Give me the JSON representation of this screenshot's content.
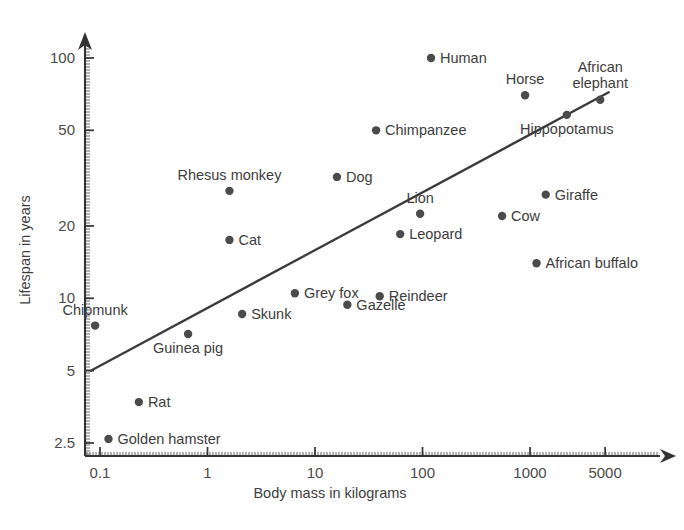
{
  "chart_data": {
    "type": "scatter",
    "title": "",
    "xlabel": "Body mass in kilograms",
    "ylabel": "Lifespan in years",
    "xscale": "log",
    "yscale": "log",
    "xlim": [
      0.07,
      9000
    ],
    "ylim": [
      2.1,
      135
    ],
    "grid": false,
    "legend": null,
    "xticks": [
      0.1,
      1,
      10,
      100,
      1000,
      5000
    ],
    "xticklabels": [
      "0.1",
      "1",
      "10",
      "100",
      "1000",
      "5000"
    ],
    "yticks": [
      2.5,
      5,
      10,
      20,
      50,
      100
    ],
    "yticklabels": [
      "2.5",
      "5",
      "10",
      "20",
      "50",
      "100"
    ],
    "trendline": {
      "type": "linear-on-log-log",
      "x_start": 0.082,
      "y_start": 5.0,
      "x_end": 5400,
      "y_end": 72
    },
    "points": [
      {
        "label": "Golden hamster",
        "x": 0.12,
        "y": 2.6,
        "label_pos": "right"
      },
      {
        "label": "Chipmunk",
        "x": 0.09,
        "y": 7.7,
        "label_pos": "above"
      },
      {
        "label": "Rat",
        "x": 0.23,
        "y": 3.7,
        "label_pos": "right"
      },
      {
        "label": "Guinea pig",
        "x": 0.66,
        "y": 7.1,
        "label_pos": "below"
      },
      {
        "label": "Cat",
        "x": 1.6,
        "y": 17.5,
        "label_pos": "right"
      },
      {
        "label": "Rhesus monkey",
        "x": 1.6,
        "y": 28,
        "label_pos": "above"
      },
      {
        "label": "Skunk",
        "x": 2.1,
        "y": 8.6,
        "label_pos": "right"
      },
      {
        "label": "Grey fox",
        "x": 6.5,
        "y": 10.5,
        "label_pos": "right"
      },
      {
        "label": "Dog",
        "x": 16,
        "y": 32,
        "label_pos": "right"
      },
      {
        "label": "Gazelle",
        "x": 20,
        "y": 9.4,
        "label_pos": "right"
      },
      {
        "label": "Chimpanzee",
        "x": 37,
        "y": 50,
        "label_pos": "right"
      },
      {
        "label": "Reindeer",
        "x": 40,
        "y": 10.2,
        "label_pos": "right"
      },
      {
        "label": "Leopard",
        "x": 62,
        "y": 18.5,
        "label_pos": "right"
      },
      {
        "label": "Lion",
        "x": 95,
        "y": 22.5,
        "label_pos": "above"
      },
      {
        "label": "Human",
        "x": 120,
        "y": 100,
        "label_pos": "right"
      },
      {
        "label": "Cow",
        "x": 550,
        "y": 22,
        "label_pos": "right"
      },
      {
        "label": "Horse",
        "x": 900,
        "y": 70,
        "label_pos": "above"
      },
      {
        "label": "African buffalo",
        "x": 1150,
        "y": 14,
        "label_pos": "right"
      },
      {
        "label": "Giraffe",
        "x": 1400,
        "y": 27,
        "label_pos": "right"
      },
      {
        "label": "Hippopotamus",
        "x": 2200,
        "y": 58,
        "label_pos": "below"
      },
      {
        "label": "African elephant",
        "x": 4500,
        "y": 67,
        "label_pos": "above"
      }
    ]
  },
  "colors": {
    "axis": "#333333",
    "point": "#4b4b4b",
    "text": "#3d3d3d",
    "background": "#ffffff"
  }
}
